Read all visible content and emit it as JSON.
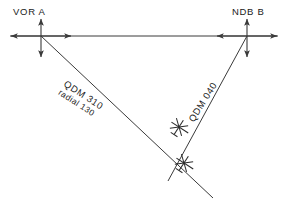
{
  "diagram": {
    "background_color": "#ffffff",
    "line_color": "#3a3a3a",
    "text_color": "#1a1a1a",
    "stations": [
      {
        "id": "vor-a",
        "label": "VOR A",
        "type": "VOR",
        "x": 41,
        "y": 36,
        "label_x": 13,
        "label_y": 6
      },
      {
        "id": "ndb-b",
        "label": "NDB B",
        "type": "NDB",
        "x": 247,
        "y": 36,
        "label_x": 232,
        "label_y": 6
      }
    ],
    "bearings": [
      {
        "id": "qdm-310",
        "label": "QDM 310",
        "sublabel": "radial 130",
        "from": "vor-a",
        "to": "aircraft-lower"
      },
      {
        "id": "qdm-040",
        "label": "QDM 040",
        "sublabel": "",
        "from": "ndb-b",
        "to": "aircraft-upper"
      }
    ],
    "aircraft": [
      {
        "id": "aircraft-upper",
        "x": 179,
        "y": 127,
        "heading_deg": 33
      },
      {
        "id": "aircraft-lower",
        "x": 184,
        "y": 163,
        "heading_deg": 33
      }
    ],
    "baseline": {
      "id": "vor-ndb-baseline",
      "from_x": 41,
      "from_y": 36,
      "to_x": 247,
      "to_y": 36
    },
    "crosshair": {
      "arm_up": 17,
      "arm_down": 21,
      "arm_left": 31,
      "arm_right": 31
    }
  }
}
